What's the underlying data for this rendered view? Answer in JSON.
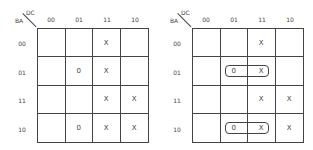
{
  "maps": [
    {
      "id": "left",
      "corner": {
        "top": "DC",
        "left": "BA"
      },
      "columns": [
        "00",
        "01",
        "11",
        "10"
      ],
      "rows": [
        "00",
        "01",
        "11",
        "10"
      ],
      "cells": [
        [
          "",
          "",
          "X",
          ""
        ],
        [
          "",
          "0",
          "X",
          ""
        ],
        [
          "",
          "",
          "X",
          "X"
        ],
        [
          "",
          "0",
          "X",
          "X"
        ]
      ],
      "loops": []
    },
    {
      "id": "right",
      "corner": {
        "top": "DC",
        "left": "BA"
      },
      "columns": [
        "00",
        "01",
        "11",
        "10"
      ],
      "rows": [
        "00",
        "01",
        "11",
        "10"
      ],
      "cells": [
        [
          "",
          "",
          "X",
          ""
        ],
        [
          "",
          "0",
          "X",
          ""
        ],
        [
          "",
          "",
          "X",
          "X"
        ],
        [
          "",
          "0",
          "X",
          "X"
        ]
      ],
      "loops": [
        {
          "row": "01",
          "from_col": "01",
          "to_col": "11"
        },
        {
          "row": "10",
          "from_col": "01",
          "to_col": "11"
        }
      ]
    }
  ]
}
